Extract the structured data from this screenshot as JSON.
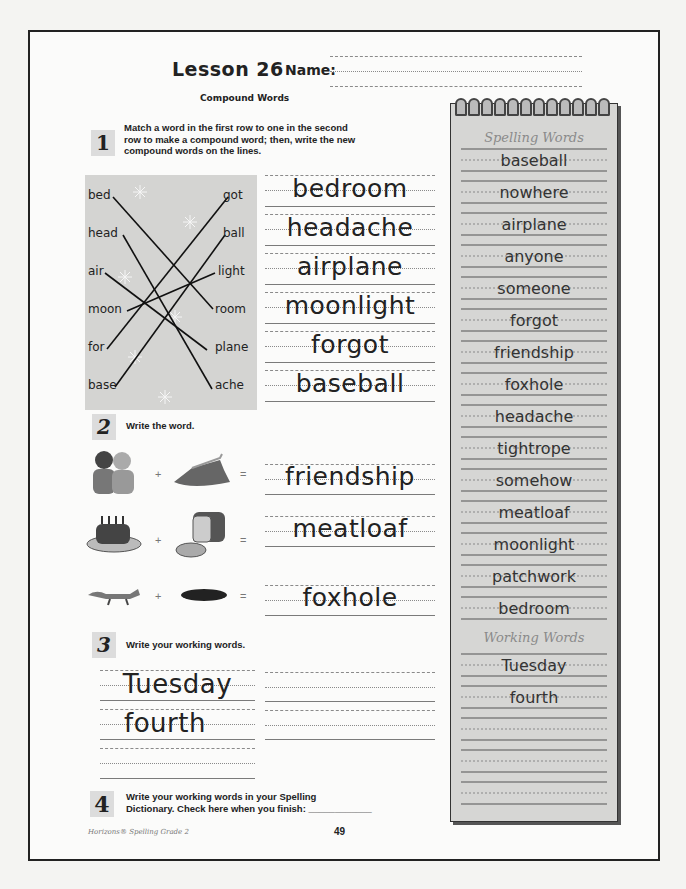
{
  "header": {
    "lesson_title": "Lesson 26",
    "name_label": "Name:",
    "subtitle": "Compound Words"
  },
  "section1": {
    "number": "1",
    "instructions": [
      "Match a word in the first row to one in the second",
      "row to make a compound word; then, write the new",
      "compound words on the lines."
    ],
    "first_row": [
      "bed",
      "head",
      "air",
      "moon",
      "for",
      "base"
    ],
    "second_row": [
      "got",
      "ball",
      "light",
      "room",
      "plane",
      "ache"
    ],
    "answers": [
      "bedroom",
      "headache",
      "airplane",
      "moonlight",
      "forgot",
      "baseball"
    ]
  },
  "section2": {
    "number": "2",
    "instructions": "Write the word.",
    "rows": [
      {
        "left_icon": "friends-picture",
        "right_icon": "ship-picture",
        "plus": "+",
        "equals": "=",
        "answer": "friendship"
      },
      {
        "left_icon": "meat-picture",
        "right_icon": "loaf-picture",
        "plus": "+",
        "equals": "=",
        "answer": "meatloaf"
      },
      {
        "left_icon": "fox-picture",
        "right_icon": "hole-picture",
        "plus": "+",
        "equals": "=",
        "answer": "foxhole"
      }
    ]
  },
  "section3": {
    "number": "3",
    "instructions": "Write your working words.",
    "answers": [
      "Tuesday",
      "fourth"
    ]
  },
  "section4": {
    "number": "4",
    "instructions": [
      "Write your working words in your Spelling",
      "Dictionary.  Check here when you finish: ____________"
    ]
  },
  "notebook": {
    "spelling_heading": "Spelling Words",
    "spelling_words": [
      "baseball",
      "nowhere",
      "airplane",
      "anyone",
      "someone",
      "forgot",
      "friendship",
      "foxhole",
      "headache",
      "tightrope",
      "somehow",
      "meatloaf",
      "moonlight",
      "patchwork",
      "bedroom"
    ],
    "working_heading": "Working Words",
    "working_words": [
      "Tuesday",
      "fourth"
    ]
  },
  "footer": {
    "publisher": "Horizons® Spelling Grade 2",
    "page_number": "49"
  }
}
